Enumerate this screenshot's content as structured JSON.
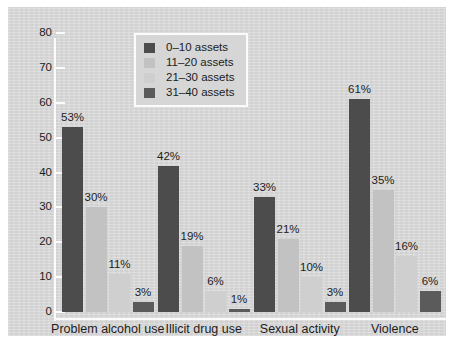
{
  "chart_data": {
    "type": "bar",
    "title": "",
    "subtitle": "",
    "xlabel": "",
    "ylabel": "",
    "ylim": [
      0,
      80
    ],
    "ytick_labels": [
      "80",
      "70",
      "60",
      "50",
      "40",
      "30",
      "20",
      "10",
      "0"
    ],
    "ytick_values": [
      80,
      70,
      60,
      50,
      40,
      30,
      20,
      10,
      0
    ],
    "grid": false,
    "legend_position": "top-left-inside",
    "categories": [
      "Problem alcohol use",
      "Illicit drug use",
      "Sexual activity",
      "Violence"
    ],
    "series": [
      {
        "name": "0–10 assets",
        "color": "#4c4c4c",
        "values": [
          53,
          42,
          33,
          61
        ],
        "data_labels": [
          "53%",
          "42%",
          "33%",
          "61%"
        ]
      },
      {
        "name": "11–20 assets",
        "color": "#c2c2c2",
        "values": [
          30,
          19,
          21,
          35
        ],
        "data_labels": [
          "30%",
          "19%",
          "21%",
          "35%"
        ]
      },
      {
        "name": "21–30 assets",
        "color": "#cfcfcf",
        "values": [
          11,
          6,
          10,
          16
        ],
        "data_labels": [
          "11%",
          "6%",
          "10%",
          "16%"
        ]
      },
      {
        "name": "31–40 assets",
        "color": "#5b5b5b",
        "values": [
          3,
          1,
          3,
          6
        ],
        "data_labels": [
          "3%",
          "1%",
          "3%",
          "6%"
        ]
      }
    ]
  },
  "legend": {
    "items": [
      {
        "label": "0–10 assets",
        "color": "#4c4c4c"
      },
      {
        "label": "11–20 assets",
        "color": "#c2c2c2"
      },
      {
        "label": "21–30 assets",
        "color": "#cfcfcf"
      },
      {
        "label": "31–40 assets",
        "color": "#5b5b5b"
      }
    ]
  },
  "colors": {
    "panel_background": "#d7d7d7",
    "page_background": "#ffffff",
    "axis_line": "#fbfbfb",
    "text": "#1d1d1d"
  }
}
